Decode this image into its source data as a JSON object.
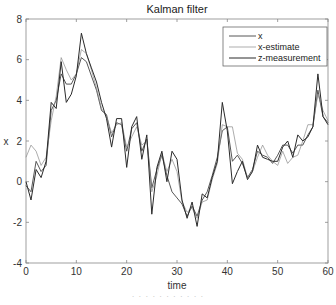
{
  "chart_data": {
    "type": "line",
    "title": "Kalman filter",
    "xlabel": "time",
    "ylabel": "x",
    "xlim": [
      0,
      60
    ],
    "ylim": [
      -4,
      8
    ],
    "xticks": [
      0,
      10,
      20,
      30,
      40,
      50,
      60
    ],
    "yticks": [
      -4,
      -2,
      0,
      2,
      4,
      6,
      8
    ],
    "grid": false,
    "legend_position": "upper right",
    "x": [
      0,
      1,
      2,
      3,
      4,
      5,
      6,
      7,
      8,
      9,
      10,
      11,
      12,
      13,
      14,
      15,
      16,
      17,
      18,
      19,
      20,
      21,
      22,
      23,
      24,
      25,
      26,
      27,
      28,
      29,
      30,
      31,
      32,
      33,
      34,
      35,
      36,
      37,
      38,
      39,
      40,
      41,
      42,
      43,
      44,
      45,
      46,
      47,
      48,
      49,
      50,
      51,
      52,
      53,
      54,
      55,
      56,
      57,
      58,
      59,
      60
    ],
    "series": [
      {
        "name": "x",
        "color": "#444444",
        "values": [
          -0.2,
          -0.5,
          1.0,
          0.5,
          0.8,
          3.5,
          4.0,
          5.3,
          4.8,
          4.8,
          5.3,
          6.1,
          5.9,
          5.2,
          4.5,
          3.5,
          3.3,
          2.2,
          2.9,
          2.8,
          1.5,
          2.6,
          2.9,
          1.5,
          2.1,
          -0.3,
          0.6,
          1.3,
          0.3,
          -0.5,
          -0.8,
          -1.1,
          -1.7,
          -1.2,
          -1.7,
          -0.9,
          -0.5,
          0.3,
          1.2,
          2.5,
          2.7,
          1.0,
          1.3,
          0.9,
          0.2,
          0.6,
          1.5,
          1.3,
          1.2,
          0.9,
          1.3,
          1.8,
          1.8,
          1.4,
          1.8,
          1.8,
          2.3,
          2.7,
          4.5,
          3.2,
          2.9
        ]
      },
      {
        "name": "x-estimate",
        "color": "#8a8a8a",
        "values": [
          1.2,
          1.8,
          1.5,
          0.8,
          1.2,
          3.0,
          4.2,
          6.1,
          5.5,
          5.0,
          5.3,
          6.5,
          6.3,
          5.5,
          4.6,
          3.6,
          3.2,
          2.4,
          2.8,
          2.9,
          1.7,
          2.2,
          2.7,
          1.8,
          2.0,
          -0.5,
          0.3,
          1.4,
          0.5,
          1.1,
          0.5,
          -1.0,
          -1.5,
          -1.3,
          -1.8,
          -1.0,
          -0.9,
          0.1,
          0.9,
          2.8,
          2.7,
          2.7,
          1.4,
          1.1,
          0.2,
          0.5,
          1.2,
          1.8,
          1.3,
          1.0,
          0.8,
          1.5,
          0.9,
          1.2,
          1.3,
          2.0,
          2.8,
          2.8,
          4.3,
          3.5,
          3.0
        ]
      },
      {
        "name": "z-measurement",
        "color": "#2a2a2a",
        "values": [
          0.0,
          -0.9,
          0.6,
          0.2,
          1.0,
          3.9,
          3.6,
          5.9,
          3.9,
          4.3,
          5.2,
          7.3,
          6.3,
          5.6,
          4.9,
          3.9,
          3.1,
          1.7,
          3.1,
          3.1,
          0.7,
          2.7,
          3.2,
          1.1,
          2.3,
          -1.6,
          0.7,
          1.5,
          0.0,
          1.5,
          1.1,
          -0.9,
          -1.8,
          -1.0,
          -2.2,
          -0.6,
          -0.8,
          0.2,
          1.0,
          3.9,
          2.5,
          -0.1,
          0.5,
          1.0,
          0.1,
          0.5,
          1.8,
          1.2,
          1.1,
          1.0,
          1.0,
          1.7,
          2.0,
          1.2,
          2.3,
          2.0,
          2.2,
          2.7,
          5.3,
          3.2,
          2.8
        ]
      }
    ]
  },
  "caption": "· · · · · · · · · · ·"
}
